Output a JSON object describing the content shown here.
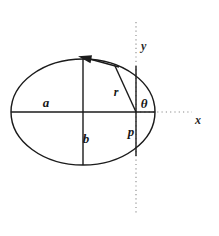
{
  "figure": {
    "kind": "ellipse-polar-geometry-diagram",
    "background_color": "#ffffff",
    "ink_color": "#1b1b1b",
    "axis_color": "#8a8a8a",
    "canvas": {
      "width": 219,
      "height": 236
    },
    "labels": {
      "semi_major_axis": "a",
      "semi_minor_axis": "b",
      "radius": "r",
      "angle": "θ",
      "semi_latus_rectum": "p",
      "x_axis": "x",
      "y_axis": "y"
    },
    "label_positions": {
      "semi_major_axis": {
        "x": 46,
        "y": 107
      },
      "semi_minor_axis": {
        "x": 85,
        "y": 142
      },
      "radius": {
        "x": 117,
        "y": 95
      },
      "angle": {
        "x": 142,
        "y": 108
      },
      "semi_latus_rectum": {
        "x": 130,
        "y": 135
      },
      "x_axis": {
        "x": 198,
        "y": 123
      },
      "y_axis": {
        "x": 140,
        "y": 49
      }
    },
    "geometry": {
      "ellipse": {
        "cx": 83,
        "cy": 112,
        "rx": 72,
        "ry": 53
      },
      "origin": {
        "x": 136,
        "y": 112
      },
      "major_axis_segment": {
        "x1": 11,
        "y1": 112,
        "x2": 155,
        "y2": 112
      },
      "minor_axis_segment": {
        "x1": 83,
        "y1": 59,
        "x2": 83,
        "y2": 165
      },
      "latus_rectum_segment": {
        "x1": 136,
        "y1": 66,
        "x2": 136,
        "y2": 156
      },
      "radius_segment": {
        "x1": 136,
        "y1": 112,
        "x2": 115,
        "y2": 66
      },
      "tangent_arrow": {
        "x1": 119,
        "y1": 67,
        "x2": 80,
        "y2": 57
      },
      "x_axis_dotted": {
        "x1": 136,
        "y1": 112,
        "x2": 192,
        "y2": 112
      },
      "y_axis_dotted": {
        "x1": 136,
        "y1": 22,
        "x2": 136,
        "y2": 214
      }
    },
    "icons": {
      "tangent_arrowhead": "arrow-left-icon"
    }
  }
}
